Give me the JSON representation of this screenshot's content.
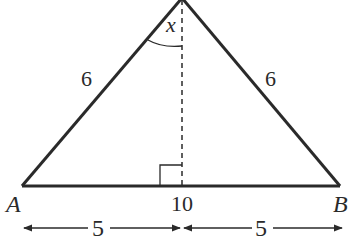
{
  "diagram": {
    "type": "isosceles-triangle",
    "colors": {
      "stroke": "#2a2a2a",
      "background": "#ffffff"
    },
    "vertices": {
      "left": {
        "label": "A"
      },
      "right": {
        "label": "B"
      }
    },
    "sides": {
      "left_side": "6",
      "right_side": "6",
      "base": "10"
    },
    "angle_label": "x",
    "base_segments": {
      "left": "5",
      "right": "5"
    },
    "altitude": {
      "style": "dashed",
      "right_angle_marker": true
    }
  }
}
